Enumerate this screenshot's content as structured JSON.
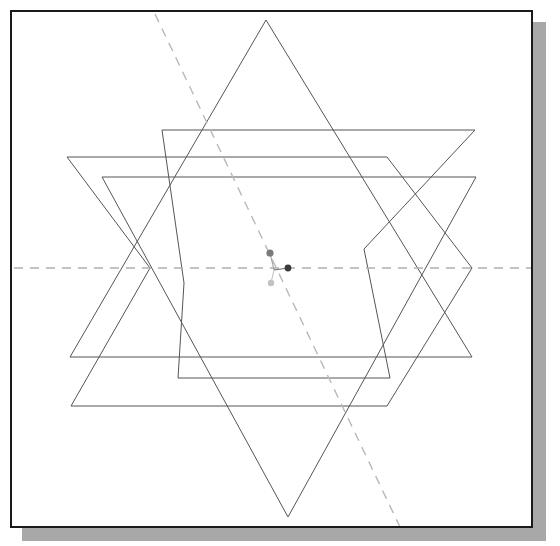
{
  "canvas": {
    "width": 560,
    "height": 546,
    "background_color": "#ffffff",
    "title": "Geometric construction: two overlapping hexagons with inscribed star triangles"
  },
  "frame": {
    "label": "drawing-frame",
    "x": 10,
    "y": 10,
    "width": 523,
    "height": 518,
    "border_color": "#1a1a1a",
    "border_width": 2,
    "fill_color": "#ffffff",
    "shadow_color": "#a8a8a8",
    "shadow_offset_x": 12,
    "shadow_offset_y": 12
  },
  "style": {
    "solid_stroke_color": "#4a4a4a",
    "solid_stroke_width": 1,
    "dashed_stroke_color": "#b0b0b0",
    "dashed_stroke_width": 1.4,
    "dash_pattern": "9 7"
  },
  "shapes": [
    {
      "name": "outer-hexagon",
      "type": "polygon",
      "stroke": "#555555",
      "stroke_width": 1,
      "fill": "none",
      "points": [
        [
          65,
          155
        ],
        [
          385,
          155
        ],
        [
          470,
          266
        ],
        [
          385,
          404
        ],
        [
          69,
          404
        ],
        [
          148,
          266
        ]
      ]
    },
    {
      "name": "inner-hexagon",
      "type": "polygon",
      "stroke": "#555555",
      "stroke_width": 1,
      "fill": "none",
      "points": [
        [
          160,
          128
        ],
        [
          473,
          128
        ],
        [
          362,
          247
        ],
        [
          388,
          376
        ],
        [
          176,
          376
        ],
        [
          182,
          281
        ]
      ]
    },
    {
      "name": "triangle-up",
      "type": "polygon",
      "stroke": "#555555",
      "stroke_width": 1,
      "fill": "none",
      "points": [
        [
          264,
          18
        ],
        [
          470,
          355
        ],
        [
          68,
          355
        ]
      ]
    },
    {
      "name": "triangle-down",
      "type": "polygon",
      "stroke": "#555555",
      "stroke_width": 1,
      "fill": "none",
      "points": [
        [
          286,
          515
        ],
        [
          100,
          175
        ],
        [
          474,
          175
        ]
      ]
    }
  ],
  "guides": [
    {
      "name": "horizontal-axis-dashed",
      "type": "line",
      "x1": 12,
      "y1": 266,
      "x2": 531,
      "y2": 266,
      "stroke": "#b0b0b0",
      "dash": "9 7"
    },
    {
      "name": "diagonal-axis-dashed",
      "type": "line",
      "x1": 153,
      "y1": 12,
      "x2": 398,
      "y2": 525,
      "stroke": "#b8b8b8",
      "dash": "9 7"
    }
  ],
  "markers": [
    {
      "name": "marker-upper",
      "x": 268,
      "y": 251,
      "radius": 3.6,
      "color": "#7a7a7a",
      "shape": "circle"
    },
    {
      "name": "marker-right",
      "x": 286,
      "y": 266,
      "radius": 3.4,
      "color": "#3c3c3c",
      "shape": "circle"
    },
    {
      "name": "marker-lower",
      "x": 269,
      "y": 281,
      "radius": 3.2,
      "color": "#c2c2c2",
      "shape": "circle"
    },
    {
      "name": "marker-connector-upper",
      "type": "line",
      "x1": 268,
      "y1": 251,
      "x2": 272,
      "y2": 268,
      "color": "#9a9a9a"
    },
    {
      "name": "marker-connector-right",
      "type": "line",
      "x1": 272,
      "y1": 268,
      "x2": 286,
      "y2": 266,
      "color": "#6a6a6a"
    },
    {
      "name": "marker-connector-lower",
      "type": "line",
      "x1": 272,
      "y1": 268,
      "x2": 269,
      "y2": 281,
      "color": "#bdbdbd"
    }
  ]
}
